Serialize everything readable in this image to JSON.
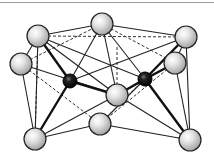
{
  "diagram": {
    "colors": {
      "background": "#ffffff",
      "bond": "#1a1a1a",
      "grey_atom_light": "#f2f2f2",
      "grey_atom_dark": "#9c9c9c",
      "dark_atom": "#111111",
      "top_rule": "#9a9a9a"
    },
    "atoms": [
      {
        "id": "top",
        "type": "grey",
        "x": 102,
        "y": 24,
        "r": 11
      },
      {
        "id": "upper-left",
        "type": "grey",
        "x": 38,
        "y": 36,
        "r": 11
      },
      {
        "id": "left",
        "type": "grey",
        "x": 21,
        "y": 64,
        "r": 11
      },
      {
        "id": "upper-right",
        "type": "grey",
        "x": 186,
        "y": 37,
        "r": 11
      },
      {
        "id": "right",
        "type": "grey",
        "x": 175,
        "y": 63,
        "r": 11
      },
      {
        "id": "center",
        "type": "grey",
        "x": 117,
        "y": 95,
        "r": 11
      },
      {
        "id": "bottom-center",
        "type": "grey",
        "x": 100,
        "y": 124,
        "r": 11
      },
      {
        "id": "bottom-left",
        "type": "grey",
        "x": 35,
        "y": 139,
        "r": 11
      },
      {
        "id": "bottom-right",
        "type": "grey",
        "x": 190,
        "y": 140,
        "r": 11
      },
      {
        "id": "dark-left",
        "type": "dark",
        "x": 70,
        "y": 81,
        "r": 7
      },
      {
        "id": "dark-right",
        "type": "dark",
        "x": 145,
        "y": 79,
        "r": 7
      }
    ]
  }
}
